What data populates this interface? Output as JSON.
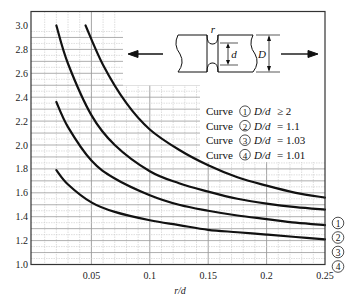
{
  "chart_data": {
    "type": "line",
    "title": "",
    "xlabel": "r/d",
    "ylabel": "",
    "xlim": [
      0,
      0.25
    ],
    "ylim": [
      1.0,
      3.0
    ],
    "grid": true,
    "x_ticks": [
      "0.05",
      "0.1",
      "0.15",
      "0.2",
      "0.25"
    ],
    "x_tick_values": [
      0.05,
      0.1,
      0.15,
      0.2,
      0.25
    ],
    "y_ticks": [
      "1.0",
      "1.2",
      "1.4",
      "1.6",
      "1.8",
      "2.0",
      "2.2",
      "2.4",
      "2.6",
      "2.8",
      "3.0"
    ],
    "y_tick_values": [
      1.0,
      1.2,
      1.4,
      1.6,
      1.8,
      2.0,
      2.2,
      2.4,
      2.6,
      2.8,
      3.0
    ],
    "legend": [
      {
        "marker": "1",
        "prefix": "Curve",
        "ratio": "D/d",
        "relation": "≥ 2"
      },
      {
        "marker": "2",
        "prefix": "Curve",
        "ratio": "D/d",
        "relation": "= 1.1"
      },
      {
        "marker": "3",
        "prefix": "Curve",
        "ratio": "D/d",
        "relation": "= 1.03"
      },
      {
        "marker": "4",
        "prefix": "Curve",
        "ratio": "D/d",
        "relation": "= 1.01"
      }
    ],
    "series": [
      {
        "name": "Curve 1 (D/d ≥ 2)",
        "label": "1",
        "x": [
          0.045,
          0.06,
          0.08,
          0.1,
          0.125,
          0.15,
          0.175,
          0.2,
          0.225,
          0.25
        ],
        "y": [
          3.0,
          2.67,
          2.35,
          2.13,
          1.96,
          1.83,
          1.73,
          1.66,
          1.6,
          1.56
        ]
      },
      {
        "name": "Curve 2 (D/d = 1.1)",
        "label": "2",
        "x": [
          0.02,
          0.03,
          0.05,
          0.07,
          0.1,
          0.125,
          0.15,
          0.175,
          0.2,
          0.225,
          0.25
        ],
        "y": [
          3.0,
          2.68,
          2.25,
          2.0,
          1.78,
          1.68,
          1.61,
          1.55,
          1.51,
          1.48,
          1.46
        ]
      },
      {
        "name": "Curve 3 (D/d = 1.03)",
        "label": "3",
        "x": [
          0.02,
          0.03,
          0.05,
          0.07,
          0.1,
          0.125,
          0.15,
          0.175,
          0.2,
          0.225,
          0.25
        ],
        "y": [
          2.36,
          2.15,
          1.87,
          1.72,
          1.58,
          1.5,
          1.45,
          1.41,
          1.38,
          1.35,
          1.33
        ]
      },
      {
        "name": "Curve 4 (D/d = 1.01)",
        "label": "4",
        "x": [
          0.02,
          0.03,
          0.05,
          0.07,
          0.1,
          0.125,
          0.15,
          0.175,
          0.2,
          0.225,
          0.25
        ],
        "y": [
          1.79,
          1.67,
          1.52,
          1.44,
          1.37,
          1.33,
          1.29,
          1.27,
          1.25,
          1.23,
          1.21
        ]
      }
    ],
    "annotations": [
      "shaft diagram with groove radius r, minor diameter d, major diameter D, tensile load arrows"
    ]
  },
  "diagram": {
    "r_label": "r",
    "d_label": "d",
    "D_label": "D"
  },
  "colors": {
    "curve": "#111111",
    "grid_minor": "#c8c8c8",
    "grid_major": "#9a9a9a",
    "axis": "#333333"
  }
}
